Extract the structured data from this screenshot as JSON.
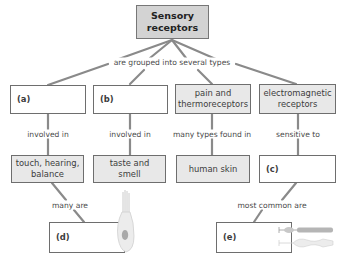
{
  "diagram": {
    "root": "Sensory receptors",
    "root_lines": [
      "Sensory",
      "receptors"
    ],
    "link_root": "are grouped into several types",
    "colors": {
      "line": "#8a8a8a",
      "root_fill": "#d3d3d3",
      "filled_box": "#e8e8e8",
      "blank_box": "#ffffff",
      "border": "#6e6e6e"
    },
    "types": [
      {
        "label": "(a)",
        "link": "involved in",
        "target": "touch, hearing, balance",
        "target_lines": [
          "touch, hearing,",
          "balance"
        ]
      },
      {
        "label": "(b)",
        "link": "involved in",
        "target": "taste and smell",
        "target_lines": [
          "taste and",
          "smell"
        ]
      },
      {
        "label": "pain and thermoreceptors",
        "label_lines": [
          "pain and",
          "thermoreceptors"
        ],
        "link": "many types found in",
        "target": "human skin"
      },
      {
        "label": "electromagnetic receptors",
        "label_lines": [
          "electromagnetic",
          "receptors"
        ],
        "link": "sensitive to",
        "target": "(c)"
      }
    ],
    "lower": [
      {
        "from": "touch, hearing, balance",
        "link": "many are",
        "target": "(d)",
        "illustration": "hair-cell-icon"
      },
      {
        "from": "(c)",
        "link": "most common are",
        "target": "(e)",
        "illustration": "rod-and-cone-cells-icon"
      }
    ]
  }
}
